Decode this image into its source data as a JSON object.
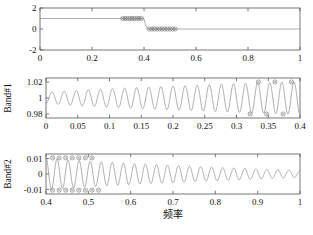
{
  "figure": {
    "background": "#ffffff",
    "line_color": "#8a8a8a",
    "axis_color": "#555555",
    "marker_color": "#777777"
  },
  "chart_data": [
    {
      "id": "panel-top",
      "type": "line",
      "title": "",
      "xlabel": "",
      "ylabel": "",
      "xlim": [
        0,
        1
      ],
      "ylim": [
        -2,
        2
      ],
      "xticks": [
        0,
        0.2,
        0.4,
        0.6,
        0.8,
        1
      ],
      "xticklabels": [
        "0",
        "0.2",
        "0.4",
        "0.6",
        "0.8",
        "1"
      ],
      "yticks": [
        -2,
        0,
        2
      ],
      "yticklabels": [
        "-2",
        "0",
        "2"
      ],
      "grid": false,
      "legend": "none",
      "series": [
        {
          "name": "ideal-band-response",
          "comment": "step from 1 to 0 at x=0.4 with narrow transition",
          "x": [
            0.0,
            0.1,
            0.2,
            0.3,
            0.34,
            0.38,
            0.395,
            0.4,
            0.405,
            0.41,
            0.42,
            0.45,
            0.5,
            0.6,
            0.7,
            0.8,
            0.9,
            1.0
          ],
          "y": [
            1.0,
            1.0,
            1.0,
            1.0,
            1.0,
            1.0,
            1.0,
            0.98,
            0.55,
            0.12,
            0.0,
            0.0,
            0.0,
            0.0,
            0.0,
            0.0,
            0.0,
            0.0
          ]
        }
      ],
      "markers": [
        {
          "x": 0.318,
          "y": 1.0
        },
        {
          "x": 0.327,
          "y": 1.0
        },
        {
          "x": 0.336,
          "y": 1.0
        },
        {
          "x": 0.345,
          "y": 1.0
        },
        {
          "x": 0.354,
          "y": 1.0
        },
        {
          "x": 0.363,
          "y": 1.0
        },
        {
          "x": 0.372,
          "y": 1.0
        },
        {
          "x": 0.381,
          "y": 1.0
        },
        {
          "x": 0.39,
          "y": 1.0
        },
        {
          "x": 0.42,
          "y": 0.0
        },
        {
          "x": 0.43,
          "y": 0.0
        },
        {
          "x": 0.44,
          "y": 0.0
        },
        {
          "x": 0.45,
          "y": 0.0
        },
        {
          "x": 0.46,
          "y": 0.0
        },
        {
          "x": 0.47,
          "y": 0.0
        },
        {
          "x": 0.48,
          "y": 0.0
        },
        {
          "x": 0.49,
          "y": 0.0
        },
        {
          "x": 0.5,
          "y": 0.0
        },
        {
          "x": 0.51,
          "y": 0.0
        },
        {
          "x": 0.52,
          "y": 0.0
        }
      ]
    },
    {
      "id": "panel-middle",
      "type": "line",
      "title": "",
      "xlabel": "",
      "ylabel": "Band#1",
      "xlim": [
        0,
        0.4
      ],
      "ylim": [
        0.975,
        1.025
      ],
      "xticks": [
        0,
        0.05,
        0.1,
        0.15,
        0.2,
        0.25,
        0.3,
        0.35,
        0.4
      ],
      "xticklabels": [
        "0",
        "0.05",
        "0.1",
        "0.15",
        "0.2",
        "0.25",
        "0.3",
        "0.35",
        "0.4"
      ],
      "yticks": [
        0.98,
        1,
        1.02
      ],
      "yticklabels": [
        "0.98",
        "1",
        "1.02"
      ],
      "grid": false,
      "legend": "none",
      "ripple": {
        "comment": "equiripple passband: cosine ripple with amplitude growing from 0.0065 to 0.020 toward band edge",
        "center": 1.0,
        "amp_start": 0.0065,
        "amp_end": 0.0205,
        "cycles": 21,
        "phase_deg": 180
      },
      "markers": [
        {
          "x": 0.3215,
          "y": 0.98
        },
        {
          "x": 0.3345,
          "y": 1.02
        },
        {
          "x": 0.3475,
          "y": 0.98
        },
        {
          "x": 0.3605,
          "y": 1.02
        },
        {
          "x": 0.3735,
          "y": 0.98
        },
        {
          "x": 0.3865,
          "y": 1.02
        }
      ]
    },
    {
      "id": "panel-bottom",
      "type": "line",
      "title": "",
      "xlabel": "频率",
      "ylabel": "Band#2",
      "xlim": [
        0.4,
        1.0
      ],
      "ylim": [
        -0.013,
        0.013
      ],
      "xticks": [
        0.4,
        0.5,
        0.6,
        0.7,
        0.8,
        0.9,
        1.0
      ],
      "xticklabels": [
        "0.4",
        "0.5",
        "0.6",
        "0.7",
        "0.8",
        "0.9",
        "1"
      ],
      "yticks": [
        -0.01,
        0,
        0.01
      ],
      "yticklabels": [
        "-0.01",
        "0",
        "0.01"
      ],
      "grid": false,
      "legend": "none",
      "ripple": {
        "comment": "stopband ripple decaying from 0.0105 at 0.41 to about 0.0022 at 1.0",
        "center": 0.0,
        "amp_start": 0.0105,
        "amp_end": 0.0022,
        "cycles": 23,
        "phase_deg": 0
      },
      "markers": [
        {
          "x": 0.4155,
          "y": 0.0105
        },
        {
          "x": 0.4155,
          "y": -0.0105
        },
        {
          "x": 0.431,
          "y": 0.0105
        },
        {
          "x": 0.431,
          "y": -0.0105
        },
        {
          "x": 0.4465,
          "y": 0.0105
        },
        {
          "x": 0.4465,
          "y": -0.0105
        },
        {
          "x": 0.462,
          "y": 0.0105
        },
        {
          "x": 0.462,
          "y": -0.0105
        },
        {
          "x": 0.4775,
          "y": 0.0105
        },
        {
          "x": 0.4775,
          "y": -0.0105
        },
        {
          "x": 0.493,
          "y": 0.0105
        },
        {
          "x": 0.493,
          "y": -0.0105
        },
        {
          "x": 0.5085,
          "y": 0.0105
        },
        {
          "x": 0.5085,
          "y": -0.0105
        },
        {
          "x": 0.524,
          "y": -0.0105
        }
      ]
    }
  ]
}
